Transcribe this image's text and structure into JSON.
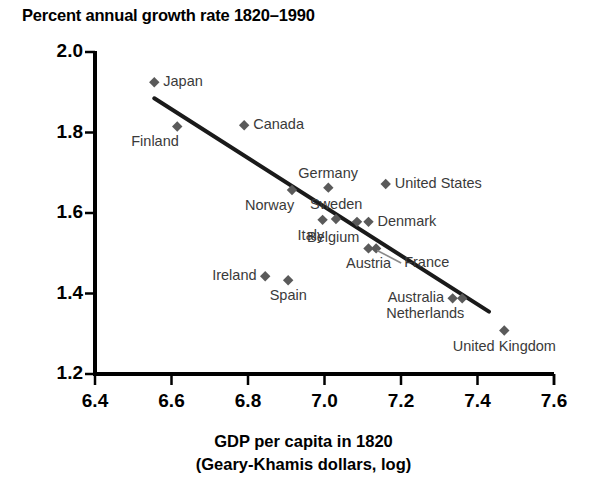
{
  "chart_data": {
    "type": "scatter",
    "title": "Percent annual growth rate 1820–1990",
    "xlabel_line1": "GDP per capita in 1820",
    "xlabel_line2": "(Geary-Khamis dollars, log)",
    "ylabel": "",
    "xlim": [
      6.4,
      7.6
    ],
    "ylim": [
      1.2,
      2.0
    ],
    "xticks": [
      "6.4",
      "6.6",
      "6.8",
      "7.0",
      "7.2",
      "7.4",
      "7.6"
    ],
    "yticks": [
      "1.2",
      "1.4",
      "1.6",
      "1.8",
      "2.0"
    ],
    "grid": false,
    "legend": "none",
    "marker_color": "#5a5a5a",
    "trendline_color": "#1a1a1a",
    "trendline": {
      "x1": 6.555,
      "y1": 1.885,
      "x2": 7.43,
      "y2": 1.355
    },
    "points": [
      {
        "label": "Japan",
        "x": 6.555,
        "y": 1.925,
        "label_pos": "right"
      },
      {
        "label": "Finland",
        "x": 6.615,
        "y": 1.815,
        "label_pos": "below-left"
      },
      {
        "label": "Canada",
        "x": 6.79,
        "y": 1.818,
        "label_pos": "right"
      },
      {
        "label": "Norway",
        "x": 6.915,
        "y": 1.657,
        "label_pos": "below-left"
      },
      {
        "label": "Germany",
        "x": 7.01,
        "y": 1.663,
        "label_pos": "above"
      },
      {
        "label": "United States",
        "x": 7.16,
        "y": 1.672,
        "label_pos": "right"
      },
      {
        "label": "Sweden",
        "x": 7.03,
        "y": 1.585,
        "label_pos": "above"
      },
      {
        "label": "Italy",
        "x": 6.995,
        "y": 1.583,
        "label_pos": "below-left"
      },
      {
        "label": "Belgium",
        "x": 7.085,
        "y": 1.578,
        "label_pos": "below-left"
      },
      {
        "label": "Denmark",
        "x": 7.115,
        "y": 1.578,
        "label_pos": "right"
      },
      {
        "label": "France",
        "x": 7.135,
        "y": 1.512,
        "label_pos": "leader-right"
      },
      {
        "label": "Austria",
        "x": 7.115,
        "y": 1.512,
        "label_pos": "below"
      },
      {
        "label": "Ireland",
        "x": 6.845,
        "y": 1.443,
        "label_pos": "left"
      },
      {
        "label": "Spain",
        "x": 6.905,
        "y": 1.433,
        "label_pos": "below"
      },
      {
        "label": "Australia",
        "x": 7.335,
        "y": 1.388,
        "label_pos": "left"
      },
      {
        "label": "Netherlands",
        "x": 7.36,
        "y": 1.388,
        "label_pos": "below-left"
      },
      {
        "label": "United Kingdom",
        "x": 7.47,
        "y": 1.308,
        "label_pos": "below"
      }
    ]
  }
}
